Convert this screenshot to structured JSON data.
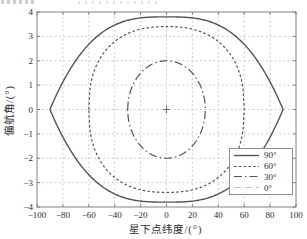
{
  "colors": {
    "background": "#ffffff",
    "axis_box": "#828282",
    "grid": "#c0c0c0",
    "text": "#2e2e2e",
    "legend_border": "#8f8f8f",
    "origin_marker": "#6f6f6f"
  },
  "chart_data": {
    "type": "line",
    "title": "",
    "xlabel": "星下点纬度/(°)",
    "ylabel": "偏航角/(°)",
    "xlim": [
      -100,
      100
    ],
    "ylim": [
      -4,
      4
    ],
    "x_ticks": [
      -100,
      -80,
      -60,
      -40,
      -20,
      0,
      20,
      40,
      60,
      80,
      100
    ],
    "y_ticks": [
      -4,
      -3,
      -2,
      -1,
      0,
      1,
      2,
      3,
      4
    ],
    "grid": true,
    "legend_position": "lower-right",
    "origin_marker": "+",
    "series": [
      {
        "name": "90°",
        "line_style": "solid",
        "dash": "",
        "width": 1.4,
        "color": "#545454",
        "lat_extent": 90,
        "peak_yaw": 3.8,
        "tip_shape": "pointed",
        "model": {
          "p": 3,
          "q": 1
        },
        "points_upper": [
          [
            -90,
            0
          ],
          [
            -80,
            1.13
          ],
          [
            -70,
            2.01
          ],
          [
            -60,
            2.67
          ],
          [
            -50,
            3.15
          ],
          [
            -40,
            3.47
          ],
          [
            -30,
            3.66
          ],
          [
            -20,
            3.76
          ],
          [
            -10,
            3.79
          ],
          [
            0,
            3.8
          ],
          [
            10,
            3.79
          ],
          [
            20,
            3.76
          ],
          [
            30,
            3.66
          ],
          [
            40,
            3.47
          ],
          [
            50,
            3.15
          ],
          [
            60,
            2.67
          ],
          [
            70,
            2.01
          ],
          [
            80,
            1.13
          ],
          [
            90,
            0
          ]
        ]
      },
      {
        "name": "60°",
        "line_style": "dashed",
        "dash": "2.6,2.2",
        "width": 1.2,
        "color": "#545454",
        "lat_extent": 60,
        "peak_yaw": 3.4,
        "tip_shape": "rounded",
        "model": {
          "p": 2.4,
          "q": 0.4167
        },
        "points_upper": [
          [
            -60,
            0
          ],
          [
            -50,
            2.21
          ],
          [
            -40,
            2.79
          ],
          [
            -30,
            3.12
          ],
          [
            -20,
            3.3
          ],
          [
            -10,
            3.38
          ],
          [
            0,
            3.4
          ],
          [
            10,
            3.38
          ],
          [
            20,
            3.3
          ],
          [
            30,
            3.12
          ],
          [
            40,
            2.79
          ],
          [
            50,
            2.21
          ],
          [
            60,
            0
          ]
        ]
      },
      {
        "name": "30°",
        "line_style": "dash-dot",
        "dash": "8,3,1.5,3",
        "width": 1.2,
        "color": "#545454",
        "lat_extent": 30,
        "peak_yaw": 2.0,
        "tip_shape": "rounded",
        "model": {
          "p": 2,
          "q": 0.5
        },
        "points_upper": [
          [
            -30,
            0
          ],
          [
            -25,
            1.11
          ],
          [
            -20,
            1.49
          ],
          [
            -15,
            1.73
          ],
          [
            -10,
            1.89
          ],
          [
            -5,
            1.97
          ],
          [
            0,
            2.0
          ],
          [
            5,
            1.97
          ],
          [
            10,
            1.89
          ],
          [
            15,
            1.73
          ],
          [
            20,
            1.49
          ],
          [
            25,
            1.11
          ],
          [
            30,
            0
          ]
        ]
      },
      {
        "name": "0°",
        "line_style": "light-dashed",
        "dash": "7,4",
        "width": 1,
        "color": "#c4c4c4",
        "lat_extent": 0,
        "peak_yaw": 0,
        "tip_shape": "point",
        "points_upper": [
          [
            0,
            0
          ]
        ]
      }
    ]
  }
}
